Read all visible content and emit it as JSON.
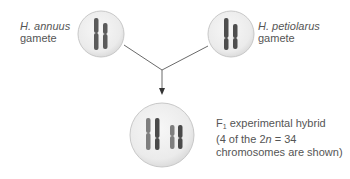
{
  "diagram": {
    "nodes": [
      {
        "id": "annuus",
        "species": "H. annuus",
        "type": "gamete",
        "chromosomes": 2
      },
      {
        "id": "petiolarus",
        "species": "H. petiolarus",
        "type": "gamete",
        "chromosomes": 2
      },
      {
        "id": "hybrid",
        "label": "F1 experimental hybrid",
        "chromosomes_shown": 4
      }
    ],
    "edges": [
      {
        "from": "annuus",
        "to": "hybrid"
      },
      {
        "from": "petiolarus",
        "to": "hybrid"
      }
    ]
  },
  "labels": {
    "annuus_species": "H. annuus",
    "annuus_type": "gamete",
    "petiolarus_species": "H. petiolarus",
    "petiolarus_type": "gamete",
    "hybrid_prefix": "F",
    "hybrid_sub": "1",
    "hybrid_line1_rest": " experimental hybrid",
    "hybrid_line2_a": "(4 of the 2",
    "hybrid_line2_n": "n",
    "hybrid_line2_b": " = 34",
    "hybrid_line3": "chromosomes are shown)"
  },
  "colors": {
    "cell_fill": "#ececec",
    "cell_stroke": "#c8c8c8",
    "chromosome_dark": "#5a5a5a",
    "chromosome_light": "#8a8a8a",
    "line": "#6a6a6a"
  }
}
